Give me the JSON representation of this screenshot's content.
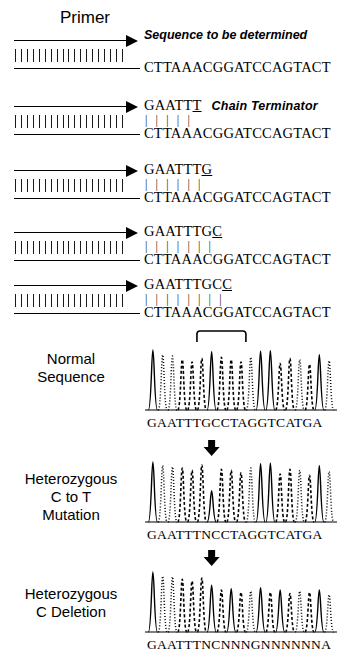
{
  "figure": {
    "title_primer": "Primer",
    "note_sequence": "Sequence to be determined",
    "note_terminator": "Chain Terminator",
    "template_strand": "CTTAAACGGATCCAGTACT",
    "hatch_count": 19
  },
  "panels": [
    {
      "id": "panel-1",
      "new_strand": "",
      "new_strand_terminal": "",
      "bridge": "",
      "template": "CTTAAACGGATCCAGTACT",
      "note": "Sequence to be determined",
      "note_position": "above"
    },
    {
      "id": "panel-2",
      "new_strand": "GAATT",
      "new_strand_terminal": "T",
      "bridge": "| | | | |",
      "template": "CTTAAACGGATCCAGTACT",
      "note": "Chain Terminator",
      "note_position": "inline"
    },
    {
      "id": "panel-3",
      "new_strand": "GAATTT",
      "new_strand_terminal": "G",
      "bridge": "| | | | | |",
      "template": "CTTAAACGGATCCAGTACT",
      "note": "",
      "note_position": "none"
    },
    {
      "id": "panel-4",
      "new_strand": "GAATTTG",
      "new_strand_terminal": "C",
      "bridge": "| | | | | | |",
      "template": "CTTAAACGGATCCAGTACT",
      "note": "",
      "note_position": "none"
    },
    {
      "id": "panel-5",
      "new_strand": "GAATTTGC",
      "new_strand_terminal": "C",
      "bridge": "| | | | | | | |",
      "template": "CTTAAACGGATCCAGTACT",
      "note": "",
      "note_position": "none"
    }
  ],
  "chromatograms": [
    {
      "id": "normal-sequence",
      "label_line1": "Normal",
      "label_line2": "Sequence",
      "label_line3": "",
      "basecalls": "GAATTTGCCTAGGTCATGA",
      "marker": "bracket",
      "marker_start_index": 5,
      "marker_end_index": 9,
      "peaks": [
        {
          "base": "G",
          "height": 1.0,
          "style": "solid"
        },
        {
          "base": "A",
          "height": 0.92,
          "style": "dotted"
        },
        {
          "base": "A",
          "height": 0.9,
          "style": "dotted"
        },
        {
          "base": "T",
          "height": 0.84,
          "style": "dashed"
        },
        {
          "base": "T",
          "height": 0.8,
          "style": "dashed"
        },
        {
          "base": "T",
          "height": 0.86,
          "style": "dashed"
        },
        {
          "base": "G",
          "height": 0.97,
          "style": "solid"
        },
        {
          "base": "C",
          "height": 0.88,
          "style": "dashed"
        },
        {
          "base": "C",
          "height": 0.84,
          "style": "dashed"
        },
        {
          "base": "T",
          "height": 0.8,
          "style": "dashed"
        },
        {
          "base": "A",
          "height": 0.88,
          "style": "dotted"
        },
        {
          "base": "G",
          "height": 0.98,
          "style": "solid"
        },
        {
          "base": "G",
          "height": 0.99,
          "style": "solid"
        },
        {
          "base": "T",
          "height": 0.78,
          "style": "dashed"
        },
        {
          "base": "C",
          "height": 0.86,
          "style": "dashed"
        },
        {
          "base": "A",
          "height": 0.84,
          "style": "dotted"
        },
        {
          "base": "T",
          "height": 0.76,
          "style": "dashed"
        },
        {
          "base": "G",
          "height": 0.92,
          "style": "solid"
        },
        {
          "base": "A",
          "height": 0.82,
          "style": "dotted"
        }
      ]
    },
    {
      "id": "heterozygous-c-to-t",
      "label_line1": "Heterozygous",
      "label_line2": "C to T",
      "label_line3": "Mutation",
      "basecalls": "GAATTTNCCTAGGTCATGA",
      "marker": "arrow",
      "marker_index": 6,
      "peaks": [
        {
          "base": "G",
          "height": 1.0,
          "style": "solid"
        },
        {
          "base": "A",
          "height": 0.94,
          "style": "dotted"
        },
        {
          "base": "A",
          "height": 0.92,
          "style": "dotted"
        },
        {
          "base": "T",
          "height": 0.9,
          "style": "dashed"
        },
        {
          "base": "T",
          "height": 0.86,
          "style": "dashed"
        },
        {
          "base": "T",
          "height": 0.95,
          "style": "dashed"
        },
        {
          "base": "N",
          "height": 0.52,
          "style": "solid"
        },
        {
          "base": "C",
          "height": 0.88,
          "style": "dashed"
        },
        {
          "base": "C",
          "height": 0.86,
          "style": "dashed"
        },
        {
          "base": "T",
          "height": 0.82,
          "style": "dashed"
        },
        {
          "base": "A",
          "height": 0.9,
          "style": "dotted"
        },
        {
          "base": "G",
          "height": 0.97,
          "style": "solid"
        },
        {
          "base": "G",
          "height": 0.98,
          "style": "solid"
        },
        {
          "base": "T",
          "height": 0.8,
          "style": "dashed"
        },
        {
          "base": "C",
          "height": 0.88,
          "style": "dashed"
        },
        {
          "base": "A",
          "height": 0.86,
          "style": "dotted"
        },
        {
          "base": "T",
          "height": 0.78,
          "style": "dashed"
        },
        {
          "base": "G",
          "height": 0.94,
          "style": "solid"
        },
        {
          "base": "A",
          "height": 0.84,
          "style": "dotted"
        }
      ]
    },
    {
      "id": "heterozygous-c-deletion",
      "label_line1": "Heterozygous",
      "label_line2": "C Deletion",
      "label_line3": "",
      "basecalls": "GAATTTNCNNNGNNNNNNA",
      "marker": "arrow",
      "marker_index": 6,
      "peaks": [
        {
          "base": "G",
          "height": 1.0,
          "style": "solid"
        },
        {
          "base": "A",
          "height": 0.93,
          "style": "dotted"
        },
        {
          "base": "A",
          "height": 0.92,
          "style": "dotted"
        },
        {
          "base": "T",
          "height": 0.88,
          "style": "dashed"
        },
        {
          "base": "T",
          "height": 0.85,
          "style": "dashed"
        },
        {
          "base": "T",
          "height": 0.9,
          "style": "dashed"
        },
        {
          "base": "N",
          "height": 0.78,
          "style": "solid"
        },
        {
          "base": "C",
          "height": 0.7,
          "style": "dashed"
        },
        {
          "base": "N",
          "height": 0.72,
          "style": "solid"
        },
        {
          "base": "N",
          "height": 0.66,
          "style": "dashed"
        },
        {
          "base": "N",
          "height": 0.68,
          "style": "dotted"
        },
        {
          "base": "G",
          "height": 0.74,
          "style": "solid"
        },
        {
          "base": "N",
          "height": 0.66,
          "style": "dashed"
        },
        {
          "base": "N",
          "height": 0.7,
          "style": "solid"
        },
        {
          "base": "N",
          "height": 0.64,
          "style": "dashed"
        },
        {
          "base": "N",
          "height": 0.68,
          "style": "dotted"
        },
        {
          "base": "N",
          "height": 0.66,
          "style": "dashed"
        },
        {
          "base": "N",
          "height": 0.7,
          "style": "solid"
        },
        {
          "base": "A",
          "height": 0.62,
          "style": "dotted"
        }
      ]
    }
  ]
}
